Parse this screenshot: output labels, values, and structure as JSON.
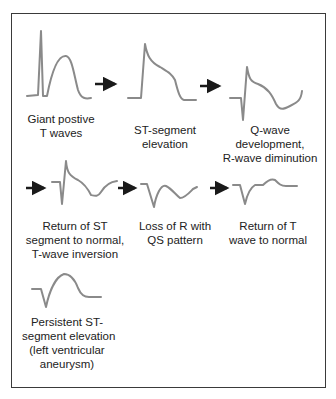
{
  "diagram": {
    "colors": {
      "wave": "#8a8a8a",
      "arrow": "#1a1a1a",
      "border": "#3a3a3a",
      "text": "#222222"
    },
    "stages": [
      {
        "id": "giant-positive-t-waves",
        "label_lines": [
          "Giant postive",
          "T waves"
        ]
      },
      {
        "id": "st-segment-elevation",
        "label_lines": [
          "ST-segment",
          "elevation"
        ]
      },
      {
        "id": "q-wave-development",
        "label_lines": [
          "Q-wave",
          "development,",
          "R-wave diminution"
        ]
      },
      {
        "id": "return-st-normal",
        "label_lines": [
          "Return of ST",
          "segment to normal,",
          "T-wave inversion"
        ]
      },
      {
        "id": "loss-of-r-qs",
        "label_lines": [
          "Loss of R with",
          "QS pattern"
        ]
      },
      {
        "id": "return-t-normal",
        "label_lines": [
          "Return of T",
          "wave to normal"
        ]
      },
      {
        "id": "persistent-st-elevation",
        "label_lines": [
          "Persistent ST-",
          "segment elevation",
          "(left ventricular",
          "aneurysm)"
        ]
      }
    ]
  }
}
